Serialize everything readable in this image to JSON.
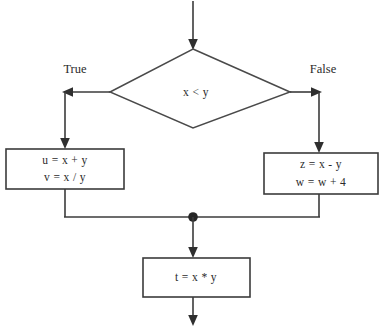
{
  "diagram": {
    "type": "flowchart",
    "background_color": "#ffffff",
    "stroke_color": "#3b3b3b",
    "text_color": "#2b2b2b",
    "junction_color": "#262626",
    "nodes": {
      "entry": {
        "kind": "entry-arrow",
        "label": ""
      },
      "decision": {
        "kind": "decision",
        "condition": "x < y"
      },
      "true_branch": {
        "kind": "process",
        "label": "True",
        "line1": "u = x + y",
        "line2": "v = x  / y"
      },
      "false_branch": {
        "kind": "process",
        "label": "False",
        "line1": "z =  x - y",
        "line2": "w = w + 4"
      },
      "merge": {
        "kind": "junction",
        "label": ""
      },
      "final": {
        "kind": "process",
        "line1": "t = x * y"
      },
      "exit": {
        "kind": "exit-arrow",
        "label": ""
      }
    },
    "edges": [
      {
        "from": "entry",
        "to": "decision",
        "label": ""
      },
      {
        "from": "decision",
        "to": "true_branch",
        "label": "True"
      },
      {
        "from": "decision",
        "to": "false_branch",
        "label": "False"
      },
      {
        "from": "true_branch",
        "to": "merge",
        "label": ""
      },
      {
        "from": "false_branch",
        "to": "merge",
        "label": ""
      },
      {
        "from": "merge",
        "to": "final",
        "label": ""
      },
      {
        "from": "final",
        "to": "exit",
        "label": ""
      }
    ]
  }
}
